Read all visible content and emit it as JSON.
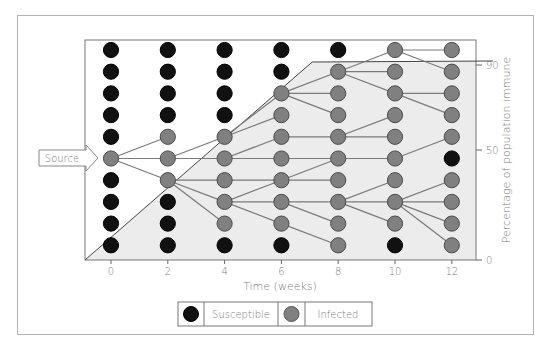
{
  "chart_data": {
    "type": "diagram",
    "title": "",
    "xlabel": "Time (weeks)",
    "ylabel": "Percentage of population immune",
    "x_ticks": [
      "0",
      "2",
      "4",
      "6",
      "8",
      "10",
      "12"
    ],
    "y_ticks": [
      {
        "label": "90",
        "value": 90
      },
      {
        "label": "50",
        "value": 50
      },
      {
        "label": "0",
        "value": 0
      }
    ],
    "rows": 10,
    "source_label": "Source",
    "legend": [
      {
        "label": "Susceptible",
        "color": "#111111"
      },
      {
        "label": "Infected",
        "color": "#7f7f7f"
      }
    ],
    "immune_curve": [
      [
        0,
        0
      ],
      [
        8,
        90
      ],
      [
        12.9,
        90
      ]
    ],
    "columns": [
      {
        "week": 0,
        "states": [
          "S",
          "S",
          "S",
          "S",
          "S",
          "I",
          "S",
          "S",
          "S",
          "S"
        ]
      },
      {
        "week": 2,
        "states": [
          "S",
          "S",
          "S",
          "S",
          "I",
          "I",
          "I",
          "S",
          "S",
          "S"
        ]
      },
      {
        "week": 4,
        "states": [
          "S",
          "S",
          "S",
          "S",
          "I",
          "I",
          "I",
          "I",
          "I",
          "S"
        ]
      },
      {
        "week": 6,
        "states": [
          "S",
          "S",
          "I",
          "I",
          "I",
          "I",
          "I",
          "I",
          "I",
          "S"
        ]
      },
      {
        "week": 8,
        "states": [
          "S",
          "I",
          "I",
          "I",
          "I",
          "I",
          "I",
          "I",
          "I",
          "I"
        ]
      },
      {
        "week": 10,
        "states": [
          "I",
          "I",
          "I",
          "I",
          "I",
          "I",
          "I",
          "I",
          "I",
          "S"
        ]
      },
      {
        "week": 12,
        "states": [
          "I",
          "I",
          "I",
          "I",
          "I",
          "S",
          "I",
          "I",
          "I",
          "I"
        ]
      }
    ],
    "edges": [
      [
        0,
        5,
        1,
        4
      ],
      [
        0,
        5,
        1,
        5
      ],
      [
        0,
        5,
        1,
        6
      ],
      [
        1,
        5,
        2,
        4
      ],
      [
        1,
        5,
        2,
        5
      ],
      [
        1,
        6,
        2,
        6
      ],
      [
        1,
        6,
        2,
        7
      ],
      [
        1,
        6,
        2,
        8
      ],
      [
        2,
        4,
        3,
        2
      ],
      [
        2,
        4,
        3,
        3
      ],
      [
        2,
        5,
        3,
        4
      ],
      [
        2,
        5,
        3,
        5
      ],
      [
        2,
        6,
        3,
        6
      ],
      [
        2,
        7,
        3,
        6
      ],
      [
        2,
        7,
        3,
        7
      ],
      [
        2,
        7,
        3,
        8
      ],
      [
        3,
        2,
        4,
        1
      ],
      [
        3,
        2,
        4,
        2
      ],
      [
        3,
        2,
        4,
        3
      ],
      [
        3,
        4,
        4,
        4
      ],
      [
        3,
        5,
        4,
        5
      ],
      [
        3,
        6,
        4,
        5
      ],
      [
        3,
        6,
        4,
        6
      ],
      [
        3,
        7,
        4,
        7
      ],
      [
        3,
        7,
        4,
        8
      ],
      [
        3,
        8,
        4,
        9
      ],
      [
        4,
        1,
        5,
        0
      ],
      [
        4,
        1,
        5,
        1
      ],
      [
        4,
        1,
        5,
        2
      ],
      [
        4,
        4,
        5,
        3
      ],
      [
        4,
        4,
        5,
        4
      ],
      [
        4,
        5,
        5,
        5
      ],
      [
        4,
        7,
        5,
        6
      ],
      [
        4,
        7,
        5,
        7
      ],
      [
        4,
        7,
        5,
        8
      ],
      [
        5,
        0,
        6,
        0
      ],
      [
        5,
        0,
        6,
        1
      ],
      [
        5,
        2,
        6,
        2
      ],
      [
        5,
        2,
        6,
        3
      ],
      [
        5,
        5,
        6,
        4
      ],
      [
        5,
        7,
        6,
        6
      ],
      [
        5,
        7,
        6,
        7
      ],
      [
        5,
        7,
        6,
        8
      ],
      [
        5,
        7,
        6,
        9
      ]
    ]
  },
  "colors": {
    "susceptible": "#111111",
    "infected": "#808080",
    "immune_fill": "#ececec",
    "line": "#7a7a7a",
    "axis": "#666666"
  }
}
